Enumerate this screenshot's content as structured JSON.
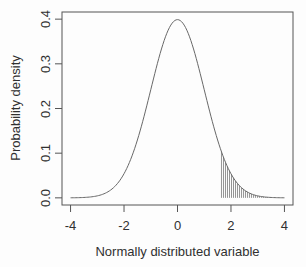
{
  "figure": {
    "background": "#fdfdfd"
  },
  "chart_data": {
    "type": "line",
    "title": "",
    "xlabel": "Normally distributed variable",
    "ylabel": "Probability density",
    "x_tick_labels": [
      "-4",
      "-2",
      "0",
      "2",
      "4"
    ],
    "y_tick_labels": [
      "0.0",
      "0.1",
      "0.2",
      "0.3",
      "0.4"
    ],
    "xlim": [
      -4.32,
      4.32
    ],
    "ylim": [
      -0.016,
      0.416
    ],
    "grid": false,
    "legend": false,
    "series": [
      {
        "name": "standard normal probability density",
        "kind": "gaussian",
        "mean": 0,
        "sd": 1,
        "x_min": -4,
        "x_max": 4,
        "peak_density": 0.3989,
        "points": [
          [
            -4.0,
            0.0001
          ],
          [
            -3.5,
            0.0009
          ],
          [
            -3.0,
            0.0044
          ],
          [
            -2.5,
            0.0175
          ],
          [
            -2.0,
            0.054
          ],
          [
            -1.5,
            0.1295
          ],
          [
            -1.0,
            0.242
          ],
          [
            -0.5,
            0.3521
          ],
          [
            0.0,
            0.3989
          ],
          [
            0.5,
            0.3521
          ],
          [
            1.0,
            0.242
          ],
          [
            1.5,
            0.1295
          ],
          [
            2.0,
            0.054
          ],
          [
            2.5,
            0.0175
          ],
          [
            3.0,
            0.0044
          ],
          [
            3.5,
            0.0009
          ],
          [
            4.0,
            0.0001
          ]
        ]
      }
    ],
    "shaded_region": {
      "from": 1.645,
      "to": 3.45,
      "style": "vertical-hatch",
      "hatch_spacing": 0.075
    },
    "colors": {
      "curve": "#686868",
      "axis": "#555555",
      "hatch": "#787878",
      "text": "#303030"
    }
  }
}
